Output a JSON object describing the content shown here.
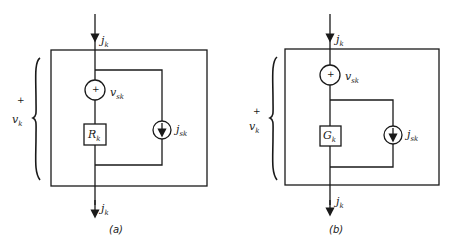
{
  "figure": {
    "panels": [
      {
        "id": "a",
        "caption": "(a)",
        "branch_current_top": {
          "symbol": "j",
          "subscript": "k"
        },
        "branch_current_bottom": {
          "symbol": "j",
          "subscript": "k"
        },
        "branch_voltage": {
          "polarity": "+",
          "symbol": "v",
          "subscript": "k"
        },
        "voltage_source": {
          "polarity": "+",
          "symbol": "v",
          "subscript": "sk"
        },
        "element": {
          "symbol": "R",
          "subscript": "k"
        },
        "current_source": {
          "symbol": "j",
          "subscript": "sk"
        },
        "topology": "voltage source in series with resistor, current source in parallel with the series combination"
      },
      {
        "id": "b",
        "caption": "(b)",
        "branch_current_top": {
          "symbol": "j",
          "subscript": "k"
        },
        "branch_current_bottom": {
          "symbol": "j",
          "subscript": "k"
        },
        "branch_voltage": {
          "polarity": "+",
          "symbol": "v",
          "subscript": "k"
        },
        "voltage_source": {
          "polarity": "+",
          "symbol": "v",
          "subscript": "sk"
        },
        "element": {
          "symbol": "G",
          "subscript": "k"
        },
        "current_source": {
          "symbol": "j",
          "subscript": "sk"
        },
        "topology": "voltage source in series with parallel combination of conductance and current source"
      }
    ]
  }
}
